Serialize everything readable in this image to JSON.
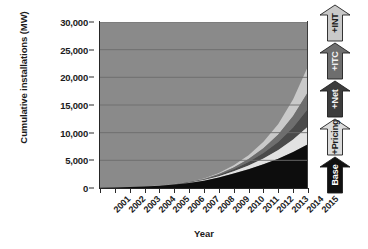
{
  "chart_data": {
    "type": "area",
    "stacked": true,
    "title": "",
    "xlabel": "Year",
    "ylabel": "Cumulative installations (MW)",
    "x": [
      2001,
      2002,
      2003,
      2004,
      2005,
      2006,
      2007,
      2008,
      2009,
      2010,
      2011,
      2012,
      2013,
      2014,
      2015
    ],
    "categories": [
      "2001",
      "2002",
      "2003",
      "2004",
      "2005",
      "2006",
      "2007",
      "2008",
      "2009",
      "2010",
      "2011",
      "2012",
      "2013",
      "2014",
      "2015"
    ],
    "xlim": [
      2001,
      2015
    ],
    "ylim": [
      0,
      30000
    ],
    "yticks": [
      0,
      5000,
      10000,
      15000,
      20000,
      25000,
      30000
    ],
    "ytick_labels": [
      "0",
      "5,000",
      "10,000",
      "15,000",
      "20,000",
      "25,000",
      "30,000"
    ],
    "grid": "horizontal",
    "legend_position": "right-arrows",
    "plot_background": "#8a8a8a",
    "series": [
      {
        "name": "Base",
        "color": "#0d0d0d",
        "values": [
          60,
          110,
          180,
          280,
          420,
          620,
          900,
          1300,
          1900,
          2600,
          3400,
          4300,
          5300,
          6500,
          7900
        ]
      },
      {
        "name": "+Pricing",
        "color": "#e2e2e2",
        "values": [
          0,
          0,
          0,
          5,
          15,
          35,
          70,
          130,
          240,
          420,
          680,
          1050,
          1550,
          2250,
          3200
        ]
      },
      {
        "name": "+Net",
        "color": "#4a4a4a",
        "values": [
          0,
          0,
          0,
          0,
          10,
          25,
          55,
          110,
          210,
          380,
          620,
          980,
          1480,
          2200,
          3200
        ]
      },
      {
        "name": "+ITC",
        "color": "#6e6e6e",
        "values": [
          0,
          0,
          0,
          0,
          5,
          15,
          40,
          85,
          170,
          320,
          540,
          870,
          1350,
          2050,
          3050
        ]
      },
      {
        "name": "+INT",
        "color": "#c9c9c9",
        "values": [
          0,
          0,
          0,
          0,
          5,
          15,
          40,
          90,
          190,
          380,
          680,
          1150,
          1900,
          3050,
          4650
        ]
      }
    ],
    "totals_by_year": [
      60,
      110,
      180,
      285,
      455,
      710,
      1105,
      1715,
      2710,
      4100,
      5920,
      8350,
      11580,
      16050,
      22000
    ]
  },
  "legend_arrows": [
    {
      "label": "+INT",
      "fill": "#c9c9c9",
      "text_color": "#1b1b1b"
    },
    {
      "label": "+ITC",
      "fill": "#6e6e6e",
      "text_color": "#f2f2f2"
    },
    {
      "label": "+Net",
      "fill": "#3c3c3c",
      "text_color": "#f2f2f2"
    },
    {
      "label": "+Pricing",
      "fill": "#dcdcdc",
      "text_color": "#1b1b1b"
    },
    {
      "label": "Base",
      "fill": "#101010",
      "text_color": "#ffffff"
    }
  ],
  "colors": {
    "plot_background": "#8a8a8a",
    "gridline": "#6d6d6d",
    "axis": "#262626",
    "text": "#1b1b1b",
    "page_background": "#ffffff"
  }
}
